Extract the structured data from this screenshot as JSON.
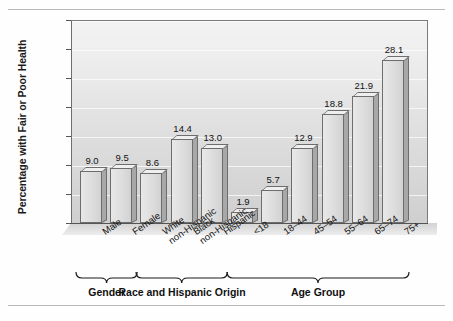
{
  "chart_data": {
    "type": "bar",
    "title": "",
    "xlabel": "",
    "ylabel": "Percentage with Fair or Poor Health",
    "ylim": [
      0,
      35
    ],
    "yticks": [
      0,
      5,
      10,
      15,
      20,
      25,
      30,
      35
    ],
    "grid": true,
    "legend": false,
    "categories": [
      "Male",
      "Female",
      "White non-Hispanic",
      "Black non-Hispanic",
      "Hispanic",
      "<18",
      "18–44",
      "45–54",
      "55–64",
      "65–74",
      "75+"
    ],
    "values": [
      9.0,
      9.5,
      8.6,
      14.4,
      13.0,
      1.9,
      5.7,
      12.9,
      18.8,
      21.9,
      28.1
    ],
    "data_labels": [
      "9.0",
      "9.5",
      "8.6",
      "14.4",
      "13.0",
      "1.9",
      "5.7",
      "12.9",
      "18.8",
      "21.9",
      "28.1"
    ],
    "category_lines": [
      [
        "Male"
      ],
      [
        "Female"
      ],
      [
        "White",
        "non-Hispanic"
      ],
      [
        "Black",
        "non-Hispanic"
      ],
      [
        "Hispanic"
      ],
      [
        "<18"
      ],
      [
        "18–44"
      ],
      [
        "45–54"
      ],
      [
        "55–64"
      ],
      [
        "65–74"
      ],
      [
        "75+"
      ]
    ],
    "groups": [
      {
        "label": "Gender",
        "start": 0,
        "end": 1
      },
      {
        "label": "Race and Hispanic Origin",
        "start": 2,
        "end": 4
      },
      {
        "label": "Age Group",
        "start": 5,
        "end": 10
      }
    ],
    "colors": {
      "bar_face": "#dddddd",
      "bar_side": "#a8a8a8",
      "bar_outline": "#6d6d6d",
      "plot_background": "#e4e4e4",
      "axis": "#555555",
      "text": "#111111"
    }
  }
}
